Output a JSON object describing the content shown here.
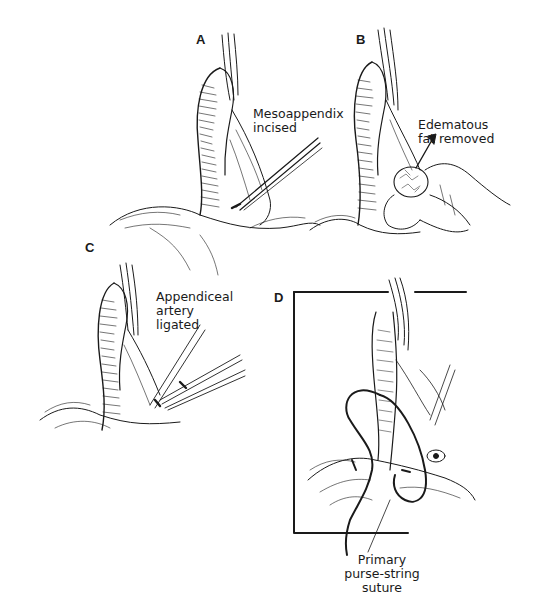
{
  "figure": {
    "panels": [
      {
        "id": "A",
        "letter": "A",
        "annotation": [
          "Mesoappendix",
          "incised"
        ]
      },
      {
        "id": "B",
        "letter": "B",
        "annotation": [
          "Edematous",
          "fat removed"
        ]
      },
      {
        "id": "C",
        "letter": "C",
        "annotation": [
          "Appendiceal",
          "artery",
          "ligated"
        ]
      },
      {
        "id": "D",
        "letter": "D",
        "annotation": [
          "Primary",
          "purse-string",
          "suture"
        ]
      }
    ],
    "colors": {
      "ink": "#1a1a1a",
      "background": "#ffffff"
    }
  }
}
